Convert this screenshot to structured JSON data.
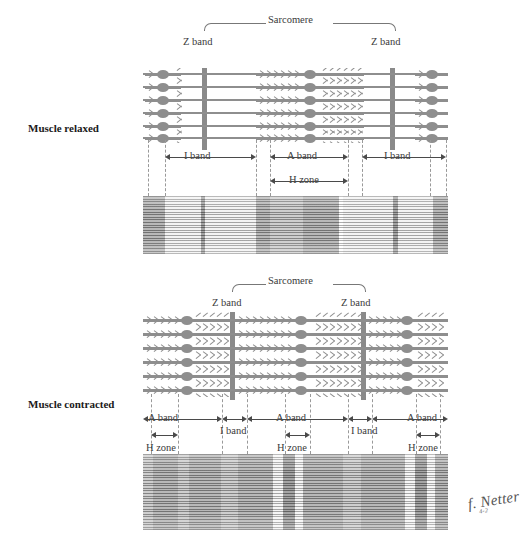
{
  "figure": {
    "signature": "f. Netter",
    "signature_sub": "4-2"
  },
  "colors": {
    "filament": "#8e8e8e",
    "zband": "#8a8a8a",
    "text": "#3a3a3a",
    "label_bold": "#1a1a1a",
    "dash": "#999999",
    "arrow": "#4a4a4a",
    "background": "#ffffff",
    "micrograph_light": "#eeeeee",
    "micrograph_dark": "#9a9a9a"
  },
  "panels": [
    {
      "id": "relaxed",
      "side_label": "Muscle relaxed",
      "sarcomere_label": "Sarcomere",
      "z_band_left_label": "Z band",
      "z_band_right_label": "Z band",
      "measurements": [
        {
          "label": "I band",
          "row": 1
        },
        {
          "label": "A band",
          "row": 1
        },
        {
          "label": "I band",
          "row": 1
        },
        {
          "label": "H zone",
          "row": 2
        }
      ]
    },
    {
      "id": "contracted",
      "side_label": "Muscle contracted",
      "sarcomere_label": "Sarcomere",
      "z_band_left_label": "Z band",
      "z_band_right_label": "Z band",
      "measurements": [
        {
          "label": "A band",
          "row": 1
        },
        {
          "label": "I band",
          "row": 1
        },
        {
          "label": "A band",
          "row": 1
        },
        {
          "label": "I band",
          "row": 1
        },
        {
          "label": "A band",
          "row": 1
        },
        {
          "label": "H zone",
          "row": 2
        },
        {
          "label": "H zone",
          "row": 2
        },
        {
          "label": "H zone",
          "row": 2
        }
      ]
    }
  ],
  "relaxed": {
    "side_label": "Muscle relaxed",
    "sarcomere": "Sarcomere",
    "zband_left": "Z band",
    "zband_right": "Z band",
    "iband_left": "I band",
    "aband": "A band",
    "iband_right": "I band",
    "hzone": "H zone"
  },
  "contracted": {
    "side_label": "Muscle contracted",
    "sarcomere": "Sarcomere",
    "zband_left": "Z band",
    "zband_right": "Z band",
    "aband_left": "A band",
    "iband_left": "I band",
    "aband_mid": "A band",
    "iband_right": "I band",
    "aband_right": "A band",
    "hzone_left": "H zone",
    "hzone_mid": "H zone",
    "hzone_right": "H zone"
  }
}
